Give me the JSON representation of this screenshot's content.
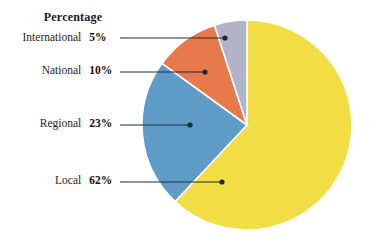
{
  "legend": {
    "header": "Percentage",
    "rows": [
      {
        "category": "International",
        "percent_label": "5%"
      },
      {
        "category": "National",
        "percent_label": "10%"
      },
      {
        "category": "Regional",
        "percent_label": "23%"
      },
      {
        "category": "Local",
        "percent_label": "62%"
      }
    ]
  },
  "chart_data": {
    "type": "pie",
    "title": "",
    "subtitle": "",
    "xlabel": "",
    "ylabel": "",
    "legend_position": "left",
    "grid": false,
    "value_suffix": "%",
    "start_angle_deg": 0,
    "direction": "clockwise",
    "categories": [
      "Local",
      "Regional",
      "National",
      "International"
    ],
    "values": [
      62,
      23,
      10,
      5
    ],
    "labels": [
      "62%",
      "23%",
      "10%",
      "5%"
    ],
    "colors": [
      "#F2DD45",
      "#5E9BC6",
      "#E8794B",
      "#B2B3C8"
    ],
    "slices": [
      {
        "name": "Local",
        "value": 62,
        "label": "62%",
        "color": "#F2DD45"
      },
      {
        "name": "Regional",
        "value": 23,
        "label": "23%",
        "color": "#5E9BC6"
      },
      {
        "name": "National",
        "value": 10,
        "label": "10%",
        "color": "#E8794B"
      },
      {
        "name": "International",
        "value": 5,
        "label": "5%",
        "color": "#B2B3C8"
      }
    ],
    "annotations": [
      {
        "text": "5%",
        "target": "International",
        "leader_dot": [
          225,
          38
        ]
      },
      {
        "text": "10%",
        "target": "National",
        "leader_dot": [
          205,
          72
        ]
      },
      {
        "text": "23%",
        "target": "Regional",
        "leader_dot": [
          190,
          125
        ]
      },
      {
        "text": "62%",
        "target": "Local",
        "leader_dot": [
          222,
          182
        ]
      }
    ]
  },
  "style": {
    "leader_line_color": "#1b2a3a",
    "slice_edge_color": "#ffffff",
    "background": "#ffffff"
  }
}
